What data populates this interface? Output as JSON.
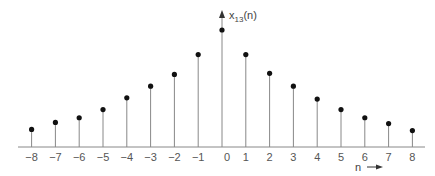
{
  "chart_data": {
    "type": "stem",
    "title": "",
    "ylabel": "x13(n)",
    "ylabel_main": "x",
    "ylabel_sub": "13",
    "ylabel_tail": "(n)",
    "xlabel": "n",
    "x": [
      -8,
      -7,
      -6,
      -5,
      -4,
      -3,
      -2,
      -1,
      0,
      1,
      2,
      3,
      4,
      5,
      6,
      7,
      8
    ],
    "tick_labels": [
      "−8",
      "−7",
      "−6",
      "−5",
      "−4",
      "−3",
      "−2",
      "−1",
      "0",
      "1",
      "2",
      "3",
      "4",
      "5",
      "6",
      "7",
      "8"
    ],
    "values": [
      0.15,
      0.21,
      0.25,
      0.32,
      0.42,
      0.52,
      0.62,
      0.79,
      1.0,
      0.79,
      0.63,
      0.52,
      0.41,
      0.32,
      0.25,
      0.2,
      0.14
    ],
    "grid": false,
    "legend": false
  },
  "layout": {
    "axis_y": 147,
    "x0": 222,
    "dx": 23.8,
    "scale": 117
  }
}
